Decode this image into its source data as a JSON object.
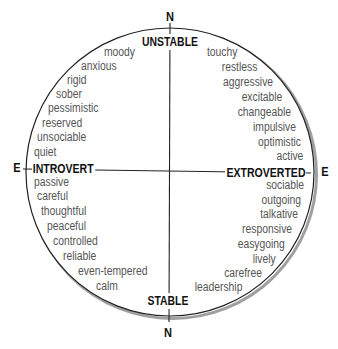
{
  "diagram": {
    "axis_labels": {
      "north_top": "N",
      "north_bottom": "N",
      "east_left": "E",
      "east_right": "E"
    },
    "poles": {
      "top": "UNSTABLE",
      "bottom": "STABLE",
      "left": "INTROVERT",
      "right": "EXTROVERTED"
    },
    "quadrants": {
      "unstable_introvert": [
        "moody",
        "anxious",
        "rigid",
        "sober",
        "pessimistic",
        "reserved",
        "unsociable",
        "quiet"
      ],
      "unstable_extrovert": [
        "touchy",
        "restless",
        "aggressive",
        "excitable",
        "changeable",
        "impulsive",
        "optimistic",
        "active"
      ],
      "stable_introvert": [
        "passive",
        "careful",
        "thoughtful",
        "peaceful",
        "controlled",
        "reliable",
        "even-tempered",
        "calm"
      ],
      "stable_extrovert": [
        "sociable",
        "outgoing",
        "talkative",
        "responsive",
        "easygoing",
        "lively",
        "carefree",
        "leadership"
      ]
    },
    "colors": {
      "trait_text": "#555555",
      "label_text": "#111111",
      "circle_line": "#222222",
      "circle_shadow": "#a0a0a0",
      "background": "#ffffff"
    }
  }
}
